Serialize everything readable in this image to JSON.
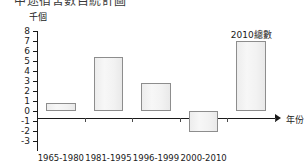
{
  "title": {
    "text": "中途宿舍數目統計圖",
    "clipped": true
  },
  "axis_unit_label": "千個",
  "xaxis_title": "年份",
  "annotations": [
    {
      "text": "2010總數",
      "x_index": 4,
      "value": 7.0
    }
  ],
  "chart_data": {
    "type": "bar",
    "title": "中途宿舍數目統計圖",
    "xlabel": "年份",
    "ylabel": "千個",
    "categories": [
      "1965-1980",
      "1981-1995",
      "1996-1999",
      "2000-2010",
      ""
    ],
    "values": [
      0.8,
      5.4,
      2.8,
      -2.1,
      7.0
    ],
    "ylim": [
      -3,
      8
    ],
    "yticks": [
      8,
      7,
      6,
      5,
      4,
      3,
      2,
      1,
      0,
      -1,
      -2,
      -3
    ],
    "ytick_labels": [
      "8",
      "7",
      "6",
      "5",
      "4",
      "3",
      "2",
      "1",
      "0",
      "-1",
      "-2",
      "-3"
    ],
    "grid": false,
    "legend": null,
    "bar_fill_color": "#f2f2f2",
    "bar_border_color": "#8d8d8d",
    "axis_color": "#1a1a1a"
  }
}
